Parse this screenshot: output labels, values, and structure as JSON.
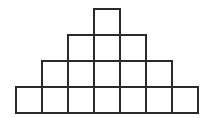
{
  "diagram": {
    "type": "square-pyramid",
    "rows": [
      1,
      3,
      5,
      7
    ],
    "total_squares": 16,
    "cell_size": 26,
    "origin_x": 16,
    "origin_y": 9,
    "line_color": "#2a2a2a",
    "line_width": 2,
    "background": "#ffffff"
  }
}
